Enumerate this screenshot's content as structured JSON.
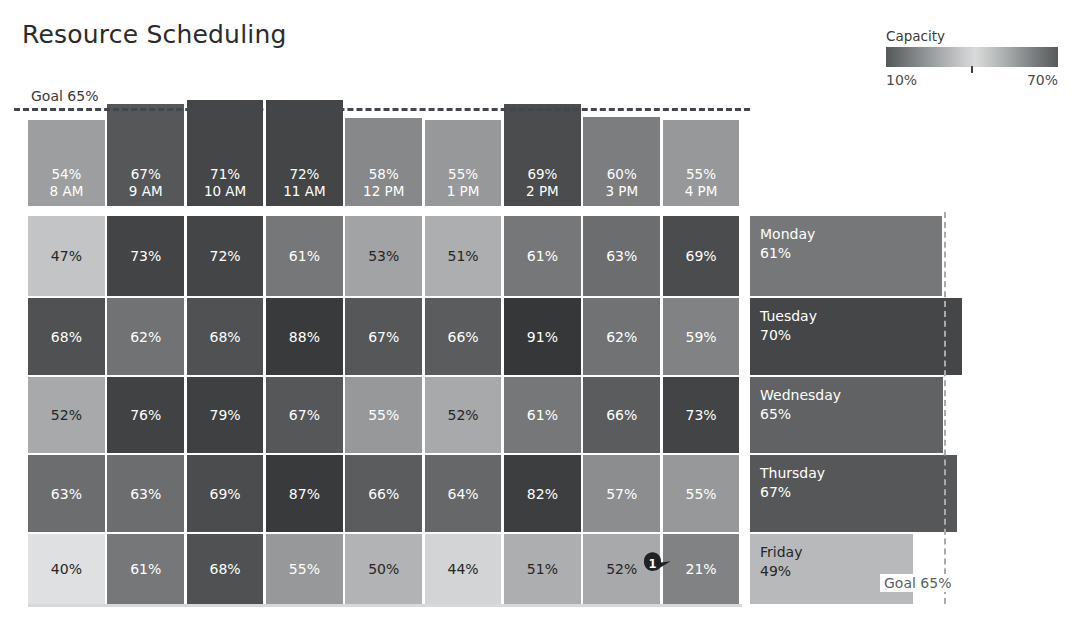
{
  "header": {
    "title": "Resource Scheduling"
  },
  "legend": {
    "title": "Capacity",
    "min_label": "10%",
    "max_label": "70%",
    "icon": "gradient-bar-icon"
  },
  "goal": {
    "top_label": "Goal 65%",
    "right_label": "Goal 65%",
    "value": 65
  },
  "marker": {
    "label": "1",
    "icon": "map-pin-marker-icon"
  },
  "chart_data": {
    "type": "heatmap",
    "title": "Resource Scheduling",
    "xlabel": "",
    "ylabel": "",
    "grid": false,
    "legend_position": "top-right",
    "colorbar": {
      "label": "Capacity",
      "min": 10,
      "max": 70,
      "min_label": "10%",
      "max_label": "70%",
      "note": "diverging grayscale: dark at 10%, light near mid, dark at 70%"
    },
    "goal_line": 65,
    "categories": [
      "8 AM",
      "9 AM",
      "10 AM",
      "11 AM",
      "12 PM",
      "1 PM",
      "2 PM",
      "3 PM",
      "4 PM"
    ],
    "rows": [
      "Monday",
      "Tuesday",
      "Wednesday",
      "Thursday",
      "Friday"
    ],
    "column_summary": {
      "name": "Hourly average",
      "values": [
        54,
        67,
        71,
        72,
        58,
        55,
        69,
        60,
        55
      ],
      "labels": [
        "54%",
        "67%",
        "71%",
        "72%",
        "58%",
        "55%",
        "69%",
        "60%",
        "55%"
      ]
    },
    "row_summary": {
      "name": "Daily average",
      "values": [
        61,
        70,
        65,
        67,
        49
      ],
      "labels": [
        "61%",
        "70%",
        "65%",
        "67%",
        "49%"
      ]
    },
    "series": [
      {
        "name": "Monday",
        "values": [
          47,
          73,
          72,
          61,
          53,
          51,
          61,
          63,
          69
        ]
      },
      {
        "name": "Tuesday",
        "values": [
          68,
          62,
          68,
          88,
          67,
          66,
          91,
          62,
          59
        ]
      },
      {
        "name": "Wednesday",
        "values": [
          52,
          76,
          79,
          67,
          55,
          52,
          61,
          66,
          73
        ]
      },
      {
        "name": "Thursday",
        "values": [
          63,
          63,
          69,
          87,
          66,
          64,
          82,
          57,
          55
        ]
      },
      {
        "name": "Friday",
        "values": [
          40,
          61,
          68,
          55,
          50,
          44,
          51,
          52,
          21
        ]
      }
    ],
    "annotations": [
      {
        "id": "1",
        "row": "Friday",
        "column": "4 PM",
        "value": 21,
        "text": "1"
      }
    ]
  },
  "hours": [
    {
      "label": "8 AM",
      "value": "54%",
      "num": 54
    },
    {
      "label": "9 AM",
      "value": "67%",
      "num": 67
    },
    {
      "label": "10 AM",
      "value": "71%",
      "num": 71
    },
    {
      "label": "11 AM",
      "value": "72%",
      "num": 72
    },
    {
      "label": "12 PM",
      "value": "58%",
      "num": 58
    },
    {
      "label": "1 PM",
      "value": "55%",
      "num": 55
    },
    {
      "label": "2 PM",
      "value": "69%",
      "num": 69
    },
    {
      "label": "3 PM",
      "value": "60%",
      "num": 60
    },
    {
      "label": "4 PM",
      "value": "55%",
      "num": 55
    }
  ],
  "days": [
    {
      "name": "Monday",
      "value": "61%",
      "num": 61
    },
    {
      "name": "Tuesday",
      "value": "70%",
      "num": 70
    },
    {
      "name": "Wednesday",
      "value": "65%",
      "num": 65
    },
    {
      "name": "Thursday",
      "value": "67%",
      "num": 67
    },
    {
      "name": "Friday",
      "value": "49%",
      "num": 49
    }
  ],
  "matrix": [
    {
      "day": "Monday",
      "cells": [
        {
          "label": "47%",
          "num": 47
        },
        {
          "label": "73%",
          "num": 73
        },
        {
          "label": "72%",
          "num": 72
        },
        {
          "label": "61%",
          "num": 61
        },
        {
          "label": "53%",
          "num": 53
        },
        {
          "label": "51%",
          "num": 51
        },
        {
          "label": "61%",
          "num": 61
        },
        {
          "label": "63%",
          "num": 63
        },
        {
          "label": "69%",
          "num": 69
        }
      ]
    },
    {
      "day": "Tuesday",
      "cells": [
        {
          "label": "68%",
          "num": 68
        },
        {
          "label": "62%",
          "num": 62
        },
        {
          "label": "68%",
          "num": 68
        },
        {
          "label": "88%",
          "num": 88
        },
        {
          "label": "67%",
          "num": 67
        },
        {
          "label": "66%",
          "num": 66
        },
        {
          "label": "91%",
          "num": 91
        },
        {
          "label": "62%",
          "num": 62
        },
        {
          "label": "59%",
          "num": 59
        }
      ]
    },
    {
      "day": "Wednesday",
      "cells": [
        {
          "label": "52%",
          "num": 52
        },
        {
          "label": "76%",
          "num": 76
        },
        {
          "label": "79%",
          "num": 79
        },
        {
          "label": "67%",
          "num": 67
        },
        {
          "label": "55%",
          "num": 55
        },
        {
          "label": "52%",
          "num": 52
        },
        {
          "label": "61%",
          "num": 61
        },
        {
          "label": "66%",
          "num": 66
        },
        {
          "label": "73%",
          "num": 73
        }
      ]
    },
    {
      "day": "Thursday",
      "cells": [
        {
          "label": "63%",
          "num": 63
        },
        {
          "label": "63%",
          "num": 63
        },
        {
          "label": "69%",
          "num": 69
        },
        {
          "label": "87%",
          "num": 87
        },
        {
          "label": "66%",
          "num": 66
        },
        {
          "label": "64%",
          "num": 64
        },
        {
          "label": "82%",
          "num": 82
        },
        {
          "label": "57%",
          "num": 57
        },
        {
          "label": "55%",
          "num": 55
        }
      ]
    },
    {
      "day": "Friday",
      "cells": [
        {
          "label": "40%",
          "num": 40
        },
        {
          "label": "61%",
          "num": 61
        },
        {
          "label": "68%",
          "num": 68
        },
        {
          "label": "55%",
          "num": 55
        },
        {
          "label": "50%",
          "num": 50
        },
        {
          "label": "44%",
          "num": 44
        },
        {
          "label": "51%",
          "num": 51
        },
        {
          "label": "52%",
          "num": 52
        },
        {
          "label": "21%",
          "num": 21
        }
      ]
    }
  ],
  "colors": {
    "dark": "#3a3d3f",
    "mid": "#8b8e90",
    "light": "#e3e5e5",
    "grid_gap": "#ffffff",
    "goal_line": "#43464a",
    "goal_line_right": "#a8abad",
    "text_dark": "#262626",
    "text_light": "#ffffff"
  }
}
